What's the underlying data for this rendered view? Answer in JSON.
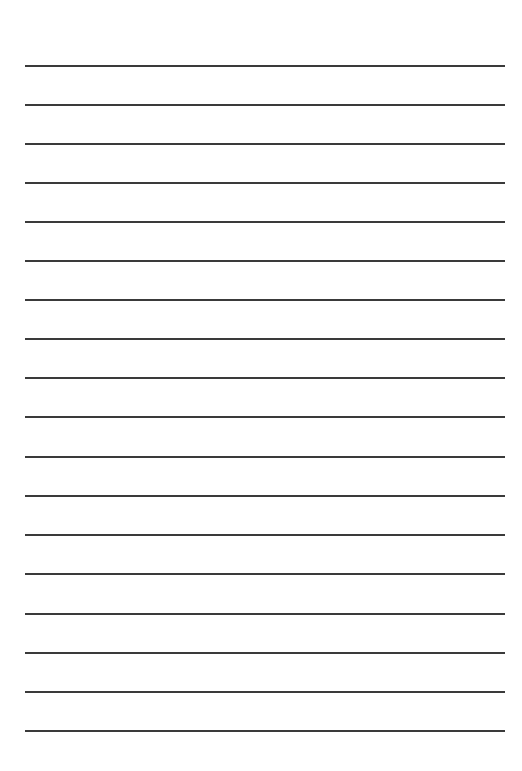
{
  "page": {
    "type": "lined-paper",
    "background": "#ffffff",
    "line_color": "#3a3a3a",
    "line_count": 18,
    "line_positions_y": [
      65,
      104,
      143,
      182,
      221,
      260,
      299,
      338,
      377,
      416,
      456,
      495,
      534,
      573,
      613,
      652,
      691,
      730
    ]
  }
}
